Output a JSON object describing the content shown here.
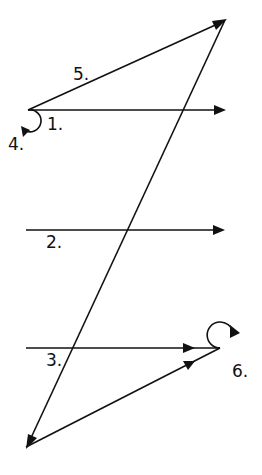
{
  "diagram": {
    "type": "path-arrows",
    "stroke_color": "#111111",
    "background": "#ffffff",
    "labels": {
      "l1": "1.",
      "l2": "2.",
      "l3": "3.",
      "l4": "4.",
      "l5": "5.",
      "l6": "6."
    },
    "segments": [
      {
        "id": "1",
        "description": "horizontal arrow pointing right from upper-left junction"
      },
      {
        "id": "2",
        "description": "horizontal arrow pointing right in middle"
      },
      {
        "id": "3",
        "description": "horizontal arrow pointing right in lower section, ending at loop 6"
      },
      {
        "id": "4",
        "description": "small clockwise loop at upper-left junction"
      },
      {
        "id": "5",
        "description": "diagonal arrow from upper-left junction to top apex"
      },
      {
        "id": "6",
        "description": "small loop at lower-right junction"
      }
    ]
  }
}
